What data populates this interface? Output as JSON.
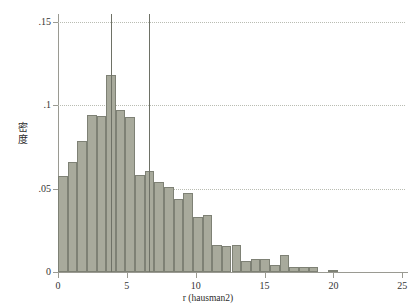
{
  "chart_data": {
    "type": "bar",
    "title": "",
    "subtitle": "",
    "xlabel": "r (hausman2)",
    "ylabel": "密度",
    "xlim": [
      0,
      25.2
    ],
    "ylim": [
      0,
      0.15
    ],
    "grid": "horizontal-dotted",
    "legend": "none",
    "bin_width": 0.7,
    "bar_color": "#a8aa9c",
    "bar_edge_color": "#7e8175",
    "grid_color": "#b9bcb2",
    "axis_color": "#9a9a92",
    "x_ticks": [
      "0",
      "5",
      "10",
      "15",
      "20",
      "25"
    ],
    "x_tick_values": [
      0,
      5,
      10,
      15,
      20,
      25
    ],
    "y_ticks": [
      "0",
      ".05",
      ".1",
      ".15"
    ],
    "y_tick_values": [
      0,
      0.05,
      0.1,
      0.15
    ],
    "categories": [
      "0.0",
      "0.7",
      "1.4",
      "2.1",
      "2.8",
      "3.5",
      "4.2",
      "4.9",
      "5.6",
      "6.3",
      "7.0",
      "7.7",
      "8.4",
      "9.1",
      "9.8",
      "10.5",
      "11.2",
      "11.9",
      "12.6",
      "13.3",
      "14.0",
      "14.7",
      "15.4",
      "16.1",
      "16.8",
      "17.5",
      "18.2",
      "18.9",
      "19.6",
      "20.3",
      "21.0",
      "21.7",
      "22.4",
      "23.1",
      "23.8",
      "24.5"
    ],
    "bin_starts": [
      0.0,
      0.7,
      1.4,
      2.1,
      2.8,
      3.5,
      4.2,
      4.9,
      5.6,
      6.3,
      7.0,
      7.7,
      8.4,
      9.1,
      9.8,
      10.5,
      11.2,
      11.9,
      12.6,
      13.3,
      14.0,
      14.7,
      15.4,
      16.1,
      16.8,
      17.5,
      18.2,
      18.9,
      19.6,
      20.3,
      21.0,
      21.7,
      22.4,
      23.1,
      23.8,
      24.5
    ],
    "values": [
      0.0575,
      0.066,
      0.0785,
      0.0945,
      0.0935,
      0.118,
      0.0975,
      0.093,
      0.0585,
      0.0605,
      0.054,
      0.051,
      0.044,
      0.0475,
      0.033,
      0.0345,
      0.0165,
      0.0155,
      0.0165,
      0.0065,
      0.008,
      0.008,
      0.004,
      0.0105,
      0.003,
      0.003,
      0.003,
      0.0,
      0.0015,
      0.0,
      0.0,
      0.0,
      0.0,
      0.0,
      0.0,
      0.0
    ],
    "reference_lines": [
      {
        "name": "lower-reference-line",
        "x": 3.85
      },
      {
        "name": "upper-reference-line",
        "x": 6.6
      }
    ]
  }
}
